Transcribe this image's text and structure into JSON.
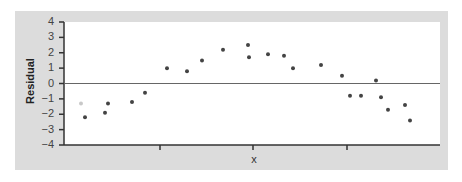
{
  "chart_data": {
    "type": "scatter",
    "title": "",
    "xlabel": "x",
    "ylabel": "Residual",
    "ylim": [
      -4,
      4
    ],
    "yticks": [
      "4",
      "3",
      "2",
      "1",
      "0",
      "−1",
      "−2",
      "−3",
      "−4"
    ],
    "xticks_unlabeled": 3,
    "grid": false,
    "reference_line": 0,
    "points": [
      {
        "x": 81,
        "y": -1.3,
        "faint": true
      },
      {
        "x": 85,
        "y": -2.2
      },
      {
        "x": 105,
        "y": -1.9
      },
      {
        "x": 108,
        "y": -1.3
      },
      {
        "x": 132,
        "y": -1.2
      },
      {
        "x": 145,
        "y": -0.6
      },
      {
        "x": 167,
        "y": 1.0
      },
      {
        "x": 187,
        "y": 0.8
      },
      {
        "x": 202,
        "y": 1.5
      },
      {
        "x": 223,
        "y": 2.2
      },
      {
        "x": 248,
        "y": 2.5
      },
      {
        "x": 249,
        "y": 1.7
      },
      {
        "x": 268,
        "y": 1.9
      },
      {
        "x": 284,
        "y": 1.8
      },
      {
        "x": 293,
        "y": 1.0
      },
      {
        "x": 321,
        "y": 1.2
      },
      {
        "x": 342,
        "y": 0.5
      },
      {
        "x": 350,
        "y": -0.8
      },
      {
        "x": 361,
        "y": -0.8
      },
      {
        "x": 376,
        "y": 0.2
      },
      {
        "x": 381,
        "y": -0.9
      },
      {
        "x": 388,
        "y": -1.7
      },
      {
        "x": 405,
        "y": -1.4
      },
      {
        "x": 410,
        "y": -2.4
      }
    ]
  }
}
